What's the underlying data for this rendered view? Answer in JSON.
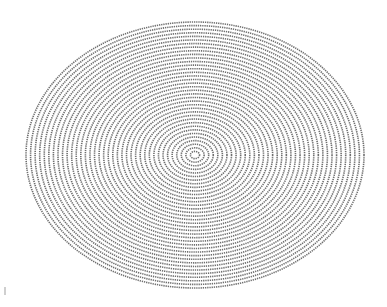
{
  "figure": {
    "type": "concentric-ellipses-illusion",
    "center": [
      195,
      155
    ],
    "outer_rx": 169,
    "outer_ry": 133,
    "ring_count": 37,
    "stroke_color": "#555555",
    "background": "#ffffff",
    "stroke_width": 1.6,
    "dash_pattern": "1.3 0.9"
  }
}
